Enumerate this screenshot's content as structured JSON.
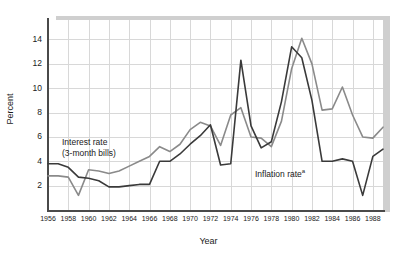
{
  "chart_data": {
    "type": "line",
    "title": "",
    "xlabel": "Year",
    "ylabel": "Percent",
    "xlim": [
      1956,
      1989
    ],
    "ylim": [
      0,
      15.6
    ],
    "grid": true,
    "legend_position": "inline-annotations",
    "xticks": [
      1956,
      1958,
      1960,
      1962,
      1964,
      1966,
      1968,
      1970,
      1972,
      1974,
      1976,
      1978,
      1980,
      1982,
      1984,
      1986,
      1988
    ],
    "xtick_labels": [
      "1956",
      "1958",
      "1960",
      "1962",
      "1964",
      "1966",
      "1968",
      "1970",
      "1972",
      "1974",
      "1976",
      "1978",
      "1980",
      "1982",
      "1984",
      "1986",
      "1988"
    ],
    "yticks": [
      2,
      4,
      6,
      8,
      10,
      12,
      14
    ],
    "ytick_labels": [
      "2",
      "4",
      "6",
      "8",
      "10",
      "12",
      "14"
    ],
    "x": [
      1956,
      1957,
      1958,
      1959,
      1960,
      1961,
      1962,
      1963,
      1964,
      1965,
      1966,
      1967,
      1968,
      1969,
      1970,
      1971,
      1972,
      1973,
      1974,
      1975,
      1976,
      1977,
      1978,
      1979,
      1980,
      1981,
      1982,
      1983,
      1984,
      1985,
      1986,
      1987,
      1988,
      1989
    ],
    "series": [
      {
        "name": "Interest rate (3-month bills)",
        "color": "#3a3a3a",
        "values": [
          3.8,
          3.8,
          3.5,
          2.7,
          2.6,
          2.4,
          1.9,
          1.9,
          2.0,
          2.1,
          2.1,
          4.0,
          4.0,
          4.6,
          5.4,
          6.1,
          7.0,
          3.7,
          3.8,
          12.3,
          6.9,
          5.1,
          5.6,
          8.9,
          13.4,
          12.5,
          9.0,
          4.0,
          4.0,
          4.2,
          4.0,
          1.2,
          4.4,
          5.0
        ]
      },
      {
        "name": "Inflation rate",
        "color": "#8a8a8a",
        "values": [
          2.8,
          2.8,
          2.7,
          1.2,
          3.3,
          3.2,
          3.0,
          3.2,
          3.6,
          4.0,
          4.4,
          5.2,
          4.8,
          5.4,
          6.6,
          7.2,
          6.9,
          5.3,
          7.8,
          8.4,
          6.0,
          5.9,
          5.2,
          7.3,
          11.6,
          14.1,
          12.0,
          8.2,
          8.3,
          10.1,
          7.8,
          6.0,
          5.9,
          6.8
        ]
      }
    ],
    "annotations": [
      {
        "id": "interest",
        "line1": "Interest rate",
        "line2": "(3-month bills)"
      },
      {
        "id": "inflation",
        "text": "Inflation rate",
        "superscript": "a"
      }
    ],
    "colors": {
      "dark_series": "#3a3a3a",
      "gray_series": "#8a8a8a",
      "grid": "#d8d8d8",
      "axis": "#4a4a4a",
      "shadow": "#cfcfcf",
      "background": "#ffffff"
    }
  }
}
